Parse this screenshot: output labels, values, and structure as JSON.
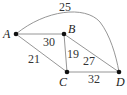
{
  "graph": {
    "nodes": [
      {
        "id": "A",
        "label": "A",
        "x": 16,
        "y": 34,
        "lx": 3,
        "ly": 38
      },
      {
        "id": "B",
        "label": "B",
        "x": 64,
        "y": 34,
        "lx": 68,
        "ly": 33
      },
      {
        "id": "C",
        "label": "C",
        "x": 67,
        "y": 72,
        "lx": 59,
        "ly": 86
      },
      {
        "id": "D",
        "label": "D",
        "x": 119,
        "y": 72,
        "lx": 116,
        "ly": 86
      }
    ],
    "edges": [
      {
        "from": "A",
        "to": "B",
        "weight": "30",
        "lx": 43,
        "ly": 46
      },
      {
        "from": "A",
        "to": "C",
        "weight": "21",
        "lx": 28,
        "ly": 63
      },
      {
        "from": "B",
        "to": "C",
        "weight": "19",
        "lx": 67,
        "ly": 58
      },
      {
        "from": "B",
        "to": "D",
        "weight": "27",
        "lx": 83,
        "ly": 65
      },
      {
        "from": "C",
        "to": "D",
        "weight": "32",
        "lx": 88,
        "ly": 83
      },
      {
        "from": "A",
        "to": "D",
        "weight": "25",
        "lx": 59,
        "ly": 11,
        "curved": true
      }
    ]
  },
  "colors": {
    "edge": "#8a8a8a",
    "node": "#111111",
    "text": "#222222"
  }
}
